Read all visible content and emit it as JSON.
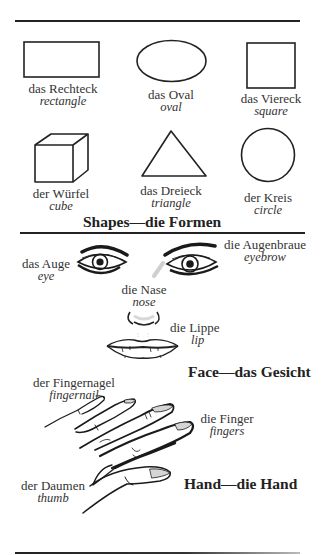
{
  "shapes": {
    "title": "Shapes—die Formen",
    "items": [
      {
        "german": "das Rechteck",
        "english": "rectangle",
        "icon": "rectangle-shape"
      },
      {
        "german": "das Oval",
        "english": "oval",
        "icon": "oval-shape"
      },
      {
        "german": "das Viereck",
        "english": "square",
        "icon": "square-shape"
      },
      {
        "german": "der Würfel",
        "english": "cube",
        "icon": "cube-shape"
      },
      {
        "german": "das Dreieck",
        "english": "triangle",
        "icon": "triangle-shape"
      },
      {
        "german": "der Kreis",
        "english": "circle",
        "icon": "circle-shape"
      }
    ]
  },
  "face": {
    "title": "Face—das Gesicht",
    "items": [
      {
        "german": "das Auge",
        "english": "eye"
      },
      {
        "german": "die Augenbraue",
        "english": "eyebrow"
      },
      {
        "german": "die Nase",
        "english": "nose"
      },
      {
        "german": "die Lippe",
        "english": "lip"
      }
    ]
  },
  "hand": {
    "title": "Hand—die Hand",
    "items": [
      {
        "german": "der Fingernagel",
        "english": "fingernail"
      },
      {
        "german": "die Finger",
        "english": "fingers"
      },
      {
        "german": "der Daumen",
        "english": "thumb"
      }
    ]
  }
}
